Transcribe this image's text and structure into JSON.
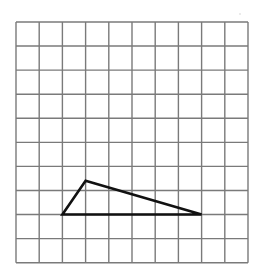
{
  "diagram": {
    "type": "grid-figure",
    "grid": {
      "columns": 10,
      "rows": 10,
      "origin_px": [
        16,
        22
      ],
      "cell_width_px": 23.2,
      "cell_height_px": 24.07,
      "line_color": "#7a7a7a",
      "line_width": 1.4
    },
    "shapes": [
      {
        "name": "triangle",
        "kind": "polygon",
        "vertices_grid": [
          [
            2,
            8
          ],
          [
            3,
            6.6
          ],
          [
            8,
            8
          ]
        ],
        "stroke_color": "#111111",
        "stroke_width": 2.6,
        "fill": "none"
      }
    ],
    "background_color": "#ffffff"
  }
}
